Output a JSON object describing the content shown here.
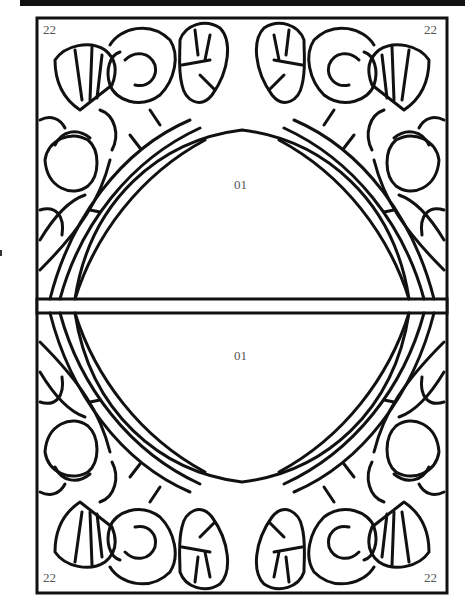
{
  "pattern": {
    "type": "stained-glass line pattern",
    "corner_labels": {
      "top_left": "22",
      "top_right": "22",
      "bottom_left": "22",
      "bottom_right": "22"
    },
    "center_labels": {
      "upper": "01",
      "lower": "01"
    },
    "colors": {
      "line": "#111111",
      "background": "#ffffff",
      "label": "#555555"
    }
  }
}
